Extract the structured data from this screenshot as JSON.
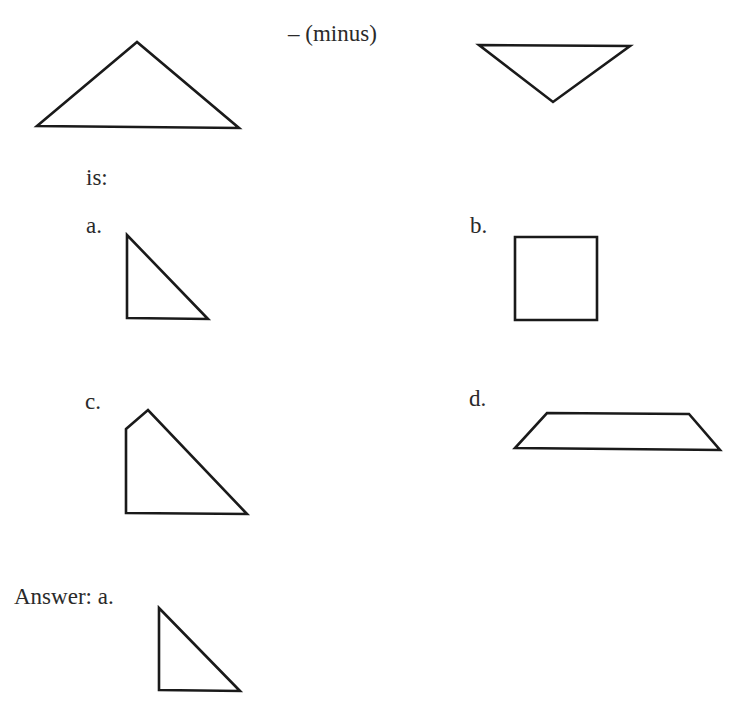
{
  "question": {
    "operator_label": "– (minus)",
    "result_label": "is:",
    "minuend_shape": "obtuse-triangle",
    "subtrahend_shape": "inverted-triangle"
  },
  "options": [
    {
      "label": "a.",
      "shape": "right-triangle"
    },
    {
      "label": "b.",
      "shape": "square"
    },
    {
      "label": "c.",
      "shape": "pentagon-cut-corner"
    },
    {
      "label": "d.",
      "shape": "trapezoid"
    }
  ],
  "answer": {
    "label": "Answer: a.",
    "shape": "right-triangle"
  },
  "colors": {
    "stroke": "#1a1a1a",
    "text": "#2a2a2a",
    "background": "#ffffff"
  }
}
